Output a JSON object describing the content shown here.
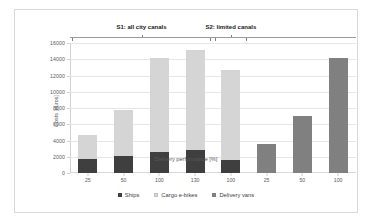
{
  "chart_data": {
    "type": "bar",
    "title": "",
    "subtitle": "",
    "xlabel": "Delivery performance [%]",
    "ylabel": "Costs [euros]",
    "categories": [
      "25",
      "50",
      "100",
      "130",
      "100",
      "25",
      "50",
      "100"
    ],
    "ylim": [
      0,
      16000
    ],
    "ytick_values": [
      0,
      2000,
      4000,
      6000,
      8000,
      10000,
      12000,
      14000,
      16000
    ],
    "ytick_labels": [
      "0",
      "2000",
      "4000",
      "6000",
      "8000",
      "10000",
      "12000",
      "14000",
      "16000"
    ],
    "grid": true,
    "stacked": true,
    "legend_position": "bottom",
    "series": [
      {
        "name": "Ships",
        "color": "#3f3f3f",
        "values": [
          1700,
          2100,
          2550,
          2800,
          1600,
          0,
          0,
          0
        ]
      },
      {
        "name": "Cargo e-bikes",
        "color": "#d5d5d5",
        "values": [
          3000,
          5700,
          11600,
          12300,
          11050,
          0,
          0,
          0
        ]
      },
      {
        "name": "Delivery vans",
        "color": "#808080",
        "values": [
          0,
          0,
          0,
          0,
          0,
          3600,
          7000,
          14100
        ]
      }
    ],
    "totals": [
      4700,
      7800,
      14150,
      15100,
      12650,
      3600,
      7000,
      14100
    ],
    "annotations": [
      {
        "label": "S1: all city canals",
        "span_start_index": 0,
        "span_end_index": 4
      },
      {
        "label": "S2: limited canals",
        "span_start_index": 4,
        "span_end_index": 5
      }
    ]
  },
  "legend": {
    "items": [
      {
        "label": "Ships",
        "marker": "ships-swatch"
      },
      {
        "label": "Cargo e-bikes",
        "marker": "cargo-ebikes-swatch"
      },
      {
        "label": "Delivery vans",
        "marker": "delivery-vans-swatch"
      }
    ]
  }
}
